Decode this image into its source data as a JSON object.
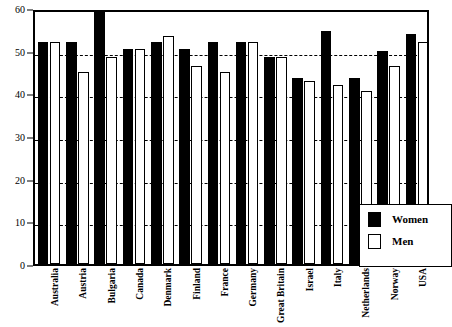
{
  "chart_data": {
    "type": "bar",
    "title": "",
    "xlabel": "",
    "ylabel": "",
    "ylim": [
      0,
      60
    ],
    "yticks": [
      0,
      10,
      20,
      30,
      40,
      50,
      60
    ],
    "grid": true,
    "grid_style": "dashed-horizontal",
    "legend_position": "inside-bottom-right",
    "categories": [
      "Australia",
      "Austria",
      "Bulgaria",
      "Canada",
      "Denmark",
      "Finland",
      "France",
      "Germany",
      "Great Britain",
      "Israel",
      "Italy",
      "Netherlands",
      "Norway",
      "USA"
    ],
    "series": [
      {
        "name": "Women",
        "color": "#000000",
        "values": [
          52,
          52,
          59,
          50.5,
          52,
          50.5,
          52,
          52,
          48.5,
          43.5,
          54.5,
          43.5,
          50,
          54
        ]
      },
      {
        "name": "Men",
        "color": "#ffffff",
        "values": [
          52,
          45,
          48.5,
          50.5,
          53.5,
          46.5,
          45,
          52,
          48.5,
          43,
          42,
          40.5,
          46.5,
          52
        ]
      }
    ]
  },
  "legend": {
    "items": [
      {
        "label": "Women",
        "swatch": "black"
      },
      {
        "label": "Men",
        "swatch": "white"
      }
    ]
  }
}
